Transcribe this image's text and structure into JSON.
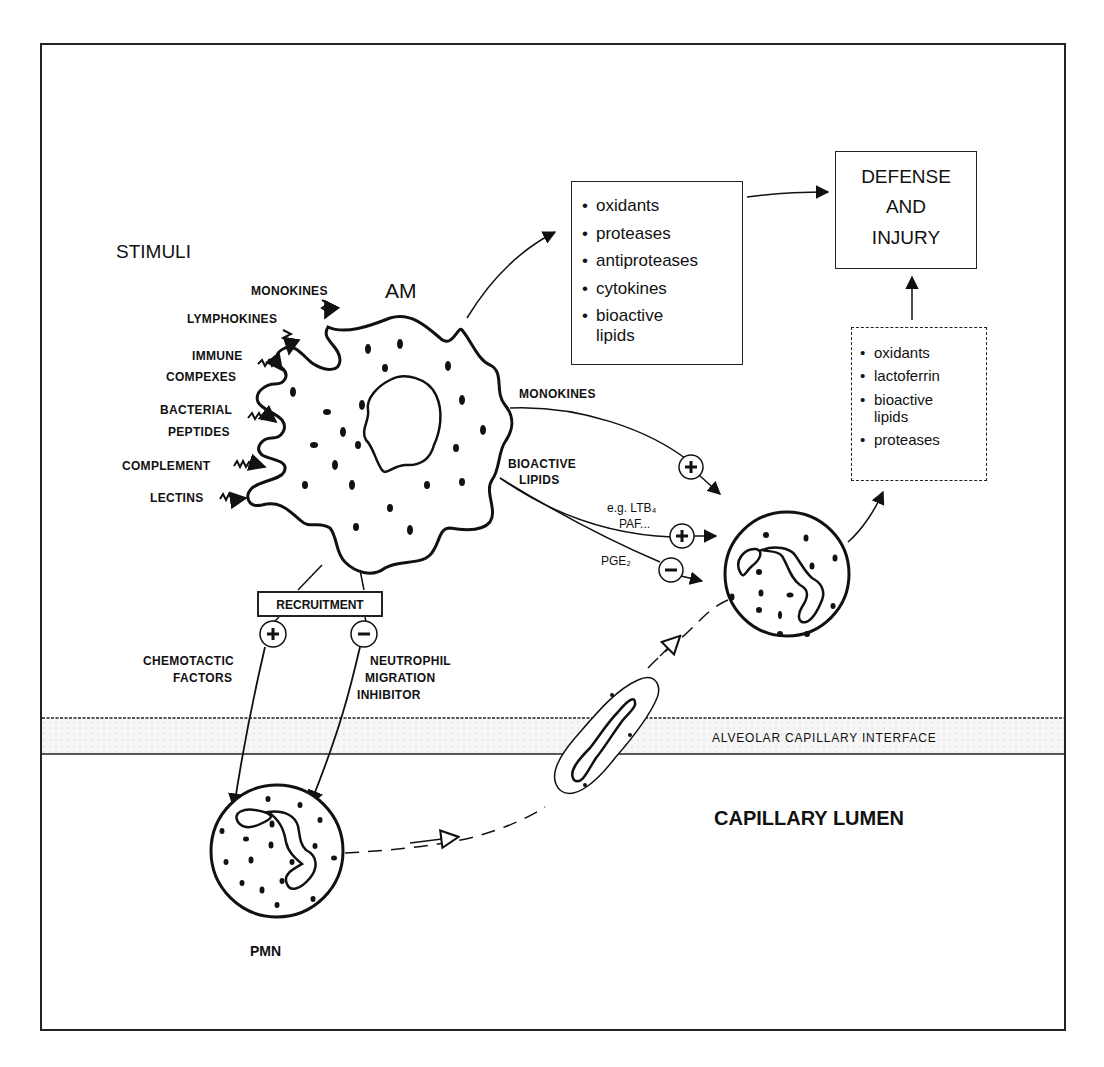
{
  "diagram": {
    "stimuli_heading": "STIMULI",
    "am_label": "AM",
    "pmn_label": "PMN",
    "stimuli": [
      {
        "label": "MONOKINES"
      },
      {
        "label": "LYMPHOKINES"
      },
      {
        "label": "IMMUNE"
      },
      {
        "label": "COMPEXES"
      },
      {
        "label": "BACTERIAL"
      },
      {
        "label": "PEPTIDES"
      },
      {
        "label": "COMPLEMENT"
      },
      {
        "label": "LECTINS"
      }
    ],
    "am_products_box": {
      "items": [
        "oxidants",
        "proteases",
        "antiproteases",
        "cytokines",
        "bioactive lipids"
      ]
    },
    "outcome_box": {
      "lines": [
        "DEFENSE",
        "AND",
        "INJURY"
      ]
    },
    "pmn_products_box": {
      "items": [
        "oxidants",
        "lactoferrin",
        "bioactive lipids",
        "proteases"
      ]
    },
    "mediators": {
      "monokines": "MONOKINES",
      "bioactive_1": "BIOACTIVE",
      "bioactive_2": "LIPIDS",
      "example_1": "e.g. LTB₄",
      "example_2": "PAF...",
      "pge2": "PGE₂",
      "plus_sign": "+",
      "minus_sign": "−"
    },
    "recruitment": {
      "label": "RECRUITMENT",
      "positive_1": "CHEMOTACTIC",
      "positive_2": "FACTORS",
      "negative_1": "NEUTROPHIL",
      "negative_2": "MIGRATION",
      "negative_3": "INHIBITOR"
    },
    "interface_label": "ALVEOLAR CAPILLARY INTERFACE",
    "lumen_label": "CAPILLARY LUMEN",
    "colors": {
      "ink": "#111111",
      "background": "#ffffff",
      "interface_fill": "#f2f2f2"
    }
  }
}
